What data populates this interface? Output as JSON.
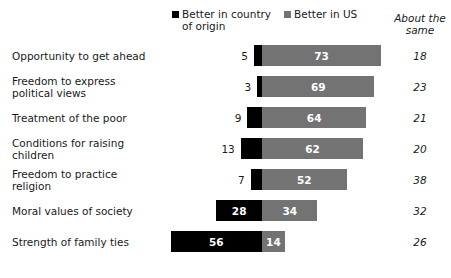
{
  "legend": {
    "origin": {
      "label": "Better in country\nof origin",
      "color": "#000000",
      "swatch_name": "legend-swatch-origin"
    },
    "us": {
      "label": "Better in US",
      "color": "#737373",
      "swatch_name": "legend-swatch-us"
    }
  },
  "about_header": "About the\nsame",
  "chart_data": {
    "type": "bar",
    "subtype": "diverging-stacked-bar",
    "title": "",
    "subtitle": "",
    "xlabel": "",
    "ylabel": "",
    "grid": false,
    "legend_position": "top",
    "axis_note": "Bars diverge from a common zero line; 'Better in country of origin' extends left, 'Better in US' extends right. 'About the same' shown as text column at right.",
    "categories": [
      "Opportunity to get ahead",
      "Freedom to express\npolitical views",
      "Treatment of the poor",
      "Conditions for raising\nchildren",
      "Freedom to practice\nreligion",
      "Moral values of society",
      "Strength of family ties"
    ],
    "series": [
      {
        "name": "Better in country of origin",
        "color": "#000000",
        "values": [
          5,
          3,
          9,
          13,
          7,
          28,
          56
        ]
      },
      {
        "name": "Better in US",
        "color": "#737373",
        "values": [
          73,
          69,
          64,
          62,
          52,
          34,
          14
        ]
      },
      {
        "name": "About the same",
        "color": "#1a1a1a",
        "values": [
          18,
          23,
          21,
          20,
          38,
          32,
          26
        ]
      }
    ]
  }
}
